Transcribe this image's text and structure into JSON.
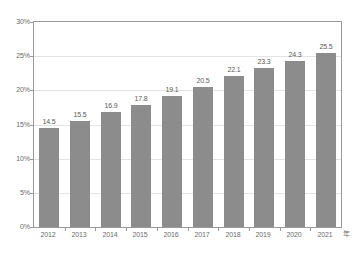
{
  "chart_data": {
    "type": "bar",
    "title": "",
    "subtitle": "",
    "xlabel": "年",
    "ylabel": "",
    "categories": [
      "2012",
      "2013",
      "2014",
      "2015",
      "2016",
      "2017",
      "2018",
      "2019",
      "2020",
      "2021"
    ],
    "values": [
      14.5,
      15.5,
      16.9,
      17.8,
      19.1,
      20.5,
      22.1,
      23.3,
      24.3,
      25.5
    ],
    "data_labels": [
      "14.5",
      "15.5",
      "16.9",
      "17.8",
      "19.1",
      "20.5",
      "22.1",
      "23.3",
      "24.3",
      "25.5"
    ],
    "ylim": [
      0,
      30
    ],
    "ytick_values": [
      0,
      5,
      10,
      15,
      20,
      25,
      30
    ],
    "ytick_labels": [
      "0%",
      "5%",
      "10%",
      "15%",
      "20%",
      "25%",
      "30%"
    ],
    "grid": true,
    "grid_axis": "y",
    "legend": false,
    "legend_position": "none",
    "series": [
      {
        "name": "",
        "values": [
          14.5,
          15.5,
          16.9,
          17.8,
          19.1,
          20.5,
          22.1,
          23.3,
          24.3,
          25.5
        ],
        "color": "#8c8c8c"
      }
    ],
    "colors": {
      "bar": "#8c8c8c",
      "gridline": "#e3e3e3",
      "axis": "#9a9a9a",
      "tick_label": "#6b6b6b",
      "data_label": "#5a5a5a",
      "plot_background": "#ffffff"
    }
  },
  "axis": {
    "x_unit_label": "年"
  }
}
